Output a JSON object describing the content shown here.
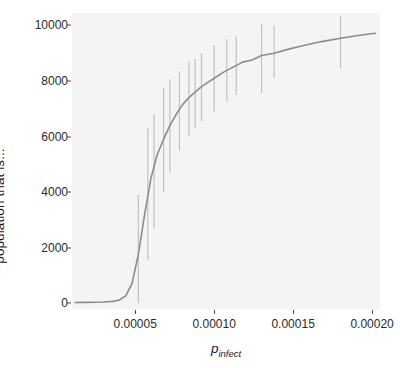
{
  "chart_data": {
    "type": "line",
    "title": "",
    "subtitle": "",
    "xlabel": "p_infect",
    "xlabel_base": "p",
    "xlabel_sub": "infect",
    "ylabel": "population that is...",
    "xlim": [
      1e-05,
      0.000205
    ],
    "ylim": [
      -250,
      10450
    ],
    "grid": false,
    "legend": false,
    "legend_position": "none",
    "xticks": [
      5e-05,
      0.0001,
      0.00015,
      0.0002
    ],
    "xtick_labels": [
      "0.00005",
      "0.00010",
      "0.00015",
      "0.00020"
    ],
    "yticks": [
      0,
      2000,
      4000,
      6000,
      8000,
      10000
    ],
    "ytick_labels": [
      "0",
      "2000",
      "4000",
      "6000",
      "8000",
      "10000"
    ],
    "line_color": "#8c8c8c",
    "errorbar_color": "#c2c2c2",
    "panel_color": "#f4f4f4",
    "background_color": "#ffffff",
    "series": [
      {
        "name": "mean population infected",
        "x": [
          1.2e-05,
          1.8e-05,
          2.4e-05,
          3e-05,
          3.6e-05,
          4e-05,
          4.4e-05,
          4.8e-05,
          5.2e-05,
          5.6e-05,
          6e-05,
          6.4e-05,
          6.8e-05,
          7.2e-05,
          7.6e-05,
          8e-05,
          8.4e-05,
          8.8e-05,
          9.2e-05,
          9.6e-05,
          0.0001,
          0.000106,
          0.000112,
          0.000118,
          0.000124,
          0.00013,
          0.000138,
          0.000146,
          0.000156,
          0.000168,
          0.00018,
          0.000192,
          0.000202
        ],
        "y": [
          20,
          25,
          30,
          40,
          60,
          110,
          260,
          700,
          1750,
          3200,
          4500,
          5350,
          5900,
          6400,
          6800,
          7150,
          7400,
          7600,
          7800,
          7950,
          8100,
          8320,
          8500,
          8680,
          8760,
          8920,
          9000,
          9130,
          9270,
          9420,
          9540,
          9650,
          9720
        ]
      }
    ],
    "errorbars": [
      {
        "x": 5.2e-05,
        "y": 1750,
        "lo": 0,
        "hi": 3900
      },
      {
        "x": 5.8e-05,
        "y": 3900,
        "lo": 1550,
        "hi": 6300
      },
      {
        "x": 6.2e-05,
        "y": 4800,
        "lo": 2700,
        "hi": 6800
      },
      {
        "x": 6.8e-05,
        "y": 5900,
        "lo": 4000,
        "hi": 7750
      },
      {
        "x": 7.2e-05,
        "y": 6400,
        "lo": 4700,
        "hi": 8050
      },
      {
        "x": 7.8e-05,
        "y": 7000,
        "lo": 5500,
        "hi": 8350
      },
      {
        "x": 8.4e-05,
        "y": 7400,
        "lo": 6000,
        "hi": 8700
      },
      {
        "x": 8.8e-05,
        "y": 7600,
        "lo": 6300,
        "hi": 8800
      },
      {
        "x": 9.2e-05,
        "y": 7800,
        "lo": 6550,
        "hi": 9000
      },
      {
        "x": 0.0001,
        "y": 8100,
        "lo": 6900,
        "hi": 9300
      },
      {
        "x": 0.000108,
        "y": 8380,
        "lo": 7250,
        "hi": 9500
      },
      {
        "x": 0.000114,
        "y": 8560,
        "lo": 7500,
        "hi": 9600
      },
      {
        "x": 0.00013,
        "y": 8920,
        "lo": 7550,
        "hi": 10050
      },
      {
        "x": 0.000138,
        "y": 9000,
        "lo": 8100,
        "hi": 10000
      },
      {
        "x": 0.00018,
        "y": 9540,
        "lo": 8450,
        "hi": 10350
      }
    ]
  }
}
